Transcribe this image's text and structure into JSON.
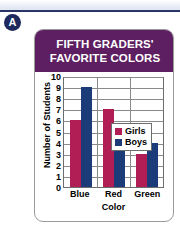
{
  "page": {
    "item_letter": "A",
    "top_rule_color": "#2a3566",
    "badge_color": "#1e2a5e"
  },
  "card": {
    "title_lines": [
      "FIFTH GRADERS'",
      "FAVORITE COLORS"
    ],
    "title_bg": "#5d1f61",
    "title_color": "#ffffff",
    "border_color": "#9a9a9a"
  },
  "chart_data": {
    "type": "bar",
    "title": "FIFTH GRADERS' FAVORITE COLORS",
    "categories": [
      "Blue",
      "Red",
      "Green"
    ],
    "series": [
      {
        "name": "Girls",
        "values": [
          6,
          7,
          3
        ],
        "color": "#b01e55"
      },
      {
        "name": "Boys",
        "values": [
          9,
          5,
          4
        ],
        "color": "#1b3c78"
      }
    ],
    "xlabel": "Color",
    "ylabel": "Number of Students",
    "ylim": [
      0,
      10
    ],
    "ytick_values": [
      10,
      9,
      8,
      7,
      6,
      5,
      4,
      3,
      2,
      1,
      0
    ],
    "grid": true,
    "legend_position": "top-right",
    "grid_color": "#8a8a8a",
    "axis_color": "#6d6d6d"
  }
}
